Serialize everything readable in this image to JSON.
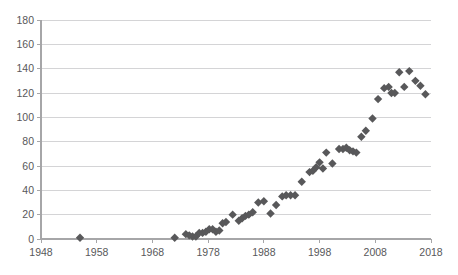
{
  "chart_data": {
    "type": "scatter",
    "title": "",
    "subtitle": "",
    "xlabel": "",
    "ylabel": "",
    "xlim": [
      1948,
      2018
    ],
    "ylim": [
      0,
      180
    ],
    "xticks": [
      1948,
      1958,
      1968,
      1978,
      1988,
      1998,
      2008,
      2018
    ],
    "yticks": [
      0,
      20,
      40,
      60,
      80,
      100,
      120,
      140,
      160,
      180
    ],
    "grid": "horizontal",
    "legend": "none",
    "marker": "diamond",
    "marker_color": "#58585a",
    "gridline_color": "#d4d4d6",
    "axis_color": "#a6a6a8",
    "background_color": "#ffffff",
    "series": [
      {
        "name": "series-1",
        "points": [
          [
            1955,
            1
          ],
          [
            1972,
            1
          ],
          [
            1974,
            4
          ],
          [
            1974.6,
            3
          ],
          [
            1975.2,
            2
          ],
          [
            1975.8,
            2
          ],
          [
            1976.4,
            5
          ],
          [
            1977,
            5
          ],
          [
            1977.6,
            6
          ],
          [
            1978.2,
            8
          ],
          [
            1978.8,
            8
          ],
          [
            1979.4,
            6
          ],
          [
            1980,
            7
          ],
          [
            1980.6,
            13
          ],
          [
            1981.2,
            14
          ],
          [
            1982.4,
            20
          ],
          [
            1983.5,
            15
          ],
          [
            1984.1,
            17
          ],
          [
            1984.7,
            19
          ],
          [
            1985.3,
            20
          ],
          [
            1986,
            22
          ],
          [
            1987,
            30
          ],
          [
            1988,
            31
          ],
          [
            1989.2,
            21
          ],
          [
            1990.2,
            28
          ],
          [
            1991.3,
            35
          ],
          [
            1992,
            36
          ],
          [
            1992.8,
            36
          ],
          [
            1993.6,
            36
          ],
          [
            1994.8,
            47
          ],
          [
            1996.2,
            55
          ],
          [
            1996.8,
            56
          ],
          [
            1997.4,
            59
          ],
          [
            1998,
            63
          ],
          [
            1998.6,
            58
          ],
          [
            1999.2,
            71
          ],
          [
            2000.3,
            62
          ],
          [
            2001.5,
            74
          ],
          [
            2002.2,
            74
          ],
          [
            2002.8,
            75
          ],
          [
            2003.4,
            73
          ],
          [
            2004,
            72
          ],
          [
            2004.6,
            71
          ],
          [
            2005.5,
            84
          ],
          [
            2006.3,
            89
          ],
          [
            2007.5,
            99
          ],
          [
            2008.5,
            115
          ],
          [
            2009.6,
            124
          ],
          [
            2010.4,
            125
          ],
          [
            2010.9,
            120
          ],
          [
            2011.5,
            120
          ],
          [
            2012.3,
            137
          ],
          [
            2013.2,
            125
          ],
          [
            2014.1,
            138
          ],
          [
            2015.2,
            130
          ],
          [
            2016.1,
            126
          ],
          [
            2017,
            119
          ]
        ]
      }
    ]
  },
  "axes": {
    "y_labels": [
      "180",
      "160",
      "140",
      "120",
      "100",
      "80",
      "60",
      "40",
      "20",
      "0"
    ],
    "x_labels": [
      "1948",
      "1958",
      "1968",
      "1978",
      "1988",
      "1998",
      "2008",
      "2018"
    ]
  }
}
